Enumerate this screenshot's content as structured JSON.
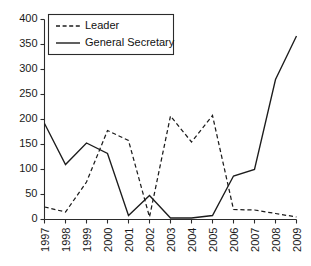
{
  "chart_data": {
    "type": "line",
    "title": "",
    "subtitle": "",
    "xlabel": "",
    "ylabel": "",
    "categories": [
      "1997",
      "1998",
      "1999",
      "2000",
      "2001",
      "2002",
      "2003",
      "2004",
      "2005",
      "2006",
      "2007",
      "2008",
      "2009"
    ],
    "series": [
      {
        "name": "Leader",
        "style": "dashed",
        "color": "#1c1c1c",
        "values": [
          25,
          15,
          75,
          178,
          158,
          5,
          207,
          155,
          208,
          20,
          19,
          12,
          5
        ]
      },
      {
        "name": "General Secretary",
        "style": "solid",
        "color": "#1c1c1c",
        "values": [
          192,
          110,
          153,
          132,
          8,
          48,
          3,
          3,
          8,
          87,
          100,
          280,
          367
        ]
      }
    ],
    "ylim": [
      0,
      400
    ],
    "yticks": [
      0,
      50,
      100,
      150,
      200,
      250,
      300,
      350,
      400
    ],
    "ytick_labels": [
      "0",
      "50",
      "100",
      "150",
      "200",
      "250",
      "300",
      "350",
      "400"
    ],
    "grid": false,
    "legend_position": "upper-left-inside",
    "xtick_rotation": 90
  },
  "axes": {
    "y_axis_name": "value-axis",
    "x_axis_name": "year-axis"
  },
  "legend": {
    "entries": [
      {
        "label": "Leader",
        "style": "dashed"
      },
      {
        "label": "General Secretary",
        "style": "solid"
      }
    ]
  }
}
